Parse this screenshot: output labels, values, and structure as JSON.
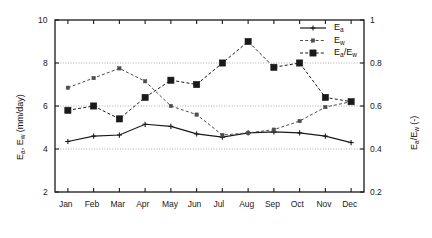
{
  "chart_data": {
    "type": "line",
    "title": "",
    "xlabel": "",
    "categories": [
      "Jan",
      "Feb",
      "Mar",
      "Apr",
      "May",
      "Jun",
      "Jul",
      "Aug",
      "Sep",
      "Oct",
      "Nov",
      "Dec"
    ],
    "grid": true,
    "gridlines_left": [
      4,
      6,
      8
    ],
    "legend_position": "top-right",
    "axes": {
      "left": {
        "label": "E_a, E_w  (mm/day)",
        "label_parts": [
          "E",
          "a",
          ", E",
          "w",
          "  (mm/day)"
        ],
        "ticks": [
          2,
          4,
          6,
          8,
          10
        ],
        "tick_labels": [
          "2",
          "4",
          "6",
          "8",
          "10"
        ],
        "ylim": [
          2,
          10
        ]
      },
      "right": {
        "label": "E_a/E_w  (-)",
        "label_parts": [
          "E",
          "a",
          "/E",
          "w",
          "  (-)"
        ],
        "ticks": [
          0.2,
          0.4,
          0.6,
          0.8,
          1
        ],
        "tick_labels": [
          "0.2",
          "0.4",
          "0.6",
          "0.8",
          "1"
        ],
        "ylim": [
          0.2,
          1.0
        ]
      }
    },
    "series": [
      {
        "name": "Ea",
        "legend_label": "E_a",
        "axis": "left",
        "style": "solid",
        "marker": "plus",
        "color": "#1a1a1a",
        "values": [
          4.35,
          4.6,
          4.65,
          5.15,
          5.05,
          4.7,
          4.55,
          4.75,
          4.8,
          4.75,
          4.6,
          4.3
        ]
      },
      {
        "name": "Ew",
        "legend_label": "E_w",
        "axis": "left",
        "style": "dashed",
        "marker": "small-square",
        "color": "#4d4d4d",
        "values": [
          6.85,
          7.3,
          7.75,
          7.15,
          6.0,
          5.6,
          4.65,
          4.75,
          4.9,
          5.3,
          5.95,
          6.2
        ]
      },
      {
        "name": "Ea/Ew",
        "legend_label": "E_a/E_w",
        "axis": "right",
        "style": "dashed",
        "marker": "square",
        "color": "#1a1a1a",
        "values": [
          0.58,
          0.6,
          0.54,
          0.64,
          0.72,
          0.7,
          0.8,
          0.9,
          0.78,
          0.8,
          0.64,
          0.62
        ]
      }
    ]
  },
  "legend": {
    "entries": [
      {
        "label_main": "E",
        "label_sub": "a"
      },
      {
        "label_main": "E",
        "label_sub": "w"
      },
      {
        "label_main": "E",
        "label_sub": "a",
        "label_main2": "/E",
        "label_sub2": "w"
      }
    ]
  }
}
